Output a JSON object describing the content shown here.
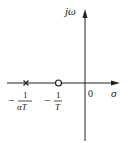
{
  "diagram": {
    "type": "s-plane pole-zero plot",
    "axes": {
      "vertical_label": "jω",
      "horizontal_label": "σ",
      "origin_label": "0"
    },
    "points": [
      {
        "kind": "pole",
        "marker": "x",
        "label_num": "1",
        "label_den": "αT",
        "label_sign": "−"
      },
      {
        "kind": "zero",
        "marker": "o",
        "label_num": "1",
        "label_den": "T",
        "label_sign": "−"
      }
    ],
    "colors": {
      "line": "#222222",
      "background": "#ffffff"
    }
  }
}
